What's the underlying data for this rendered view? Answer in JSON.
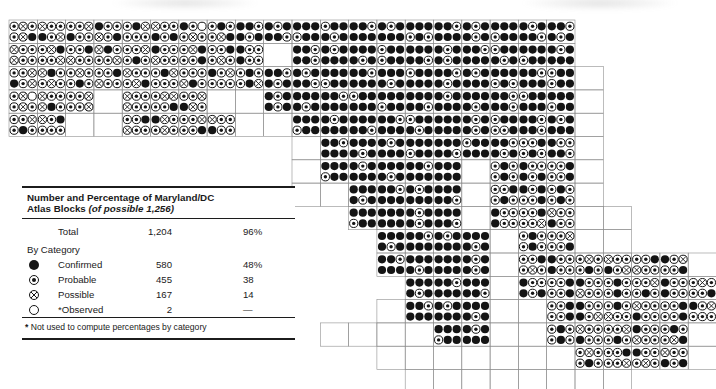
{
  "figure": {
    "kind": "atlas-distribution-map",
    "region": "Maryland/DC"
  },
  "legend": {
    "title_line1": "Number and Percentage of Maryland/DC",
    "title_line2_bold": "Atlas Blocks ",
    "title_line2_italic": "(of possible 1,256)",
    "total": {
      "label": "Total",
      "value": "1,204",
      "pct": "96%"
    },
    "by_category_label": "By Category",
    "categories": [
      {
        "symbol": "confirmed-symbol",
        "label": "Confirmed",
        "value": "580",
        "pct": "48%"
      },
      {
        "symbol": "probable-symbol",
        "label": "Probable",
        "value": "455",
        "pct": "38"
      },
      {
        "symbol": "possible-symbol",
        "label": "Possible",
        "value": "167",
        "pct": "14"
      },
      {
        "symbol": "observed-symbol",
        "label": "*Observed",
        "value": "2",
        "pct": "—"
      }
    ],
    "footnote_star": "*",
    "footnote_text": " Not used to compute percentages by category"
  },
  "map": {
    "grid": {
      "x0": 9,
      "y0": 20,
      "cell_w": 28.3,
      "cell_h": 23.3,
      "cols": 25,
      "rows": 16
    },
    "symbol_key": {
      "C": "confirmed",
      "P": "probable",
      "X": "possible",
      "O": "observed"
    },
    "colors": {
      "ink": "#141414",
      "grid": "#8f8f8f",
      "paper": "#ffffff"
    },
    "rows": [
      {
        "r": 0,
        "segs": [
          {
            "c": 0,
            "blocks": [
              "PXPPXC",
              "XPPCPX",
              "PPXCPP",
              "CPPXPC",
              "PCXPPP",
              "XPPCPC",
              "CPOPXP",
              "PCPPXC",
              "CCPCPC",
              "CPCCCP",
              "CCCPCC",
              "PCCCPC",
              "CCPCCC",
              "CPCCCC",
              "CCCPCP",
              "CCPCCC",
              "CPCCPC",
              "CCCPCC",
              "CPCCCP",
              "CCPCPC"
            ]
          }
        ]
      },
      {
        "r": 1,
        "segs": [
          {
            "c": 0,
            "blocks": [
              "XPPXPP",
              "PXCPPX",
              "PPCXPP",
              "XCPPPX",
              "PPXPCP",
              "CPPXPP",
              "PXCPPC",
              "PPCPXP",
              "CPPCPP"
            ]
          },
          {
            "c": 10,
            "blocks": [
              "CCPCCP",
              "CPCCCC",
              "CCCCPC",
              "PCCPCC",
              "CCCCCP",
              "CPCCPC",
              "CCPCCC",
              "PCCCPC",
              "CCCPCC",
              "CPCCCC"
            ]
          }
        ]
      },
      {
        "r": 2,
        "segs": [
          {
            "c": 0,
            "blocks": [
              "PPXCPX",
              "XCPPXP",
              "PXPPCP",
              "PPCXPP",
              "XPPPXC",
              "PCXPPP",
              "PPPXCP",
              "CPXPPP",
              "PCPPCX",
              "CCPCPC",
              "CPCCCP",
              "CCCPCC",
              "CCPCCC",
              "CCCCPC",
              "PCCCCC",
              "CCPCPC",
              "CPCCCC",
              "CCCPCP",
              "CCPCCC",
              "PCCPCC"
            ]
          }
        ]
      },
      {
        "r": 3,
        "segs": [
          {
            "c": 0,
            "blocks": [
              "PXOPXP",
              "XPPXCP",
              "PPXPPX"
            ]
          },
          {
            "c": 4,
            "blocks": [
              "XPPXPP",
              "PXXPPC",
              "PPXCXP"
            ]
          },
          {
            "c": 9,
            "blocks": [
              "CPCCPC",
              "CCCCPC",
              "CCPCCC",
              "PCCCCC",
              "CCCPCC",
              "CCCCCP",
              "CPCCCC",
              "CCCCPC",
              "CCPCCP",
              "PCCCCC",
              "CCCPCC"
            ]
          }
        ]
      },
      {
        "r": 4,
        "segs": [
          {
            "c": 0,
            "blocks": [
              "PPXPCP",
              "XPCPPP"
            ]
          },
          {
            "c": 4,
            "blocks": [
              "PPCXPP",
              "CXPPXP",
              "PPXPPC",
              "XPPCPP"
            ]
          },
          {
            "c": 10,
            "blocks": [
              "CCCPCC",
              "CPCCCC",
              "CCCCCP",
              "CCPCCC",
              "PCCCPC",
              "CCCCCC",
              "CPCCPC",
              "PCCPPC",
              "CCPCCP",
              "CPCCCC"
            ]
          }
        ]
      },
      {
        "r": 5,
        "segs": [
          {
            "c": 11,
            "blocks": [
              "CCPCCC",
              "CCCCPC",
              "CPCCCC",
              "CCCPCC",
              "CCCCCP",
              "PCCCCC",
              "CCPCPC",
              "PPCPCP",
              "CPPCCP"
            ]
          }
        ]
      },
      {
        "r": 6,
        "segs": [
          {
            "c": 11,
            "blocks": [
              "CCCPCC",
              "CPCCCC",
              "CCCCPC",
              "CCPCCC",
              "CCCCCC"
            ]
          },
          {
            "c": 17,
            "blocks": [
              "PCPPCP",
              "CPPCPC",
              "PPCPPC"
            ]
          }
        ]
      },
      {
        "r": 7,
        "segs": [
          {
            "c": 12,
            "blocks": [
              "CCCCPC",
              "CCPCCC",
              "CPCCCC",
              "CCCCCP"
            ]
          },
          {
            "c": 17,
            "blocks": [
              "PPCPCP",
              "CPCPPC",
              "PCPPCP"
            ]
          }
        ]
      },
      {
        "r": 8,
        "segs": [
          {
            "c": 12,
            "blocks": [
              "CCCPCC",
              "CCCCCC",
              "CPCCPC",
              "CCCCCP"
            ]
          },
          {
            "c": 17,
            "blocks": [
              "CPPCPP",
              "PPCPPX",
              "XPPCPP"
            ]
          }
        ]
      },
      {
        "r": 9,
        "segs": [
          {
            "c": 13,
            "blocks": [
              "CCCCPC",
              "CCPCCC",
              "CPCCCC",
              "CCCCPC"
            ]
          },
          {
            "c": 18,
            "blocks": [
              "PCPPCP",
              "PPXPPC"
            ]
          }
        ]
      },
      {
        "r": 10,
        "segs": [
          {
            "c": 13,
            "blocks": [
              "CCPCCC",
              "CCCCPC",
              "CCCCCC",
              "CPCCPC"
            ]
          },
          {
            "c": 18,
            "blocks": [
              "PPCPXP",
              "CPPCPP",
              "PXPPCP",
              "XPPCPX",
              "PPCXPP",
              "CPXPPC"
            ]
          }
        ]
      },
      {
        "r": 11,
        "segs": [
          {
            "c": 14,
            "blocks": [
              "CCCCPC",
              "CCPCCC",
              "CCCCCP"
            ]
          },
          {
            "c": 18,
            "blocks": [
              "CPPCPC",
              "PPCPPC",
              "CPPXPP",
              "PCPPCP",
              "PPXPCP",
              "CPPCPP",
              "PXPPPC"
            ]
          }
        ]
      },
      {
        "r": 12,
        "segs": [
          {
            "c": 14,
            "blocks": [
              "CCPCCC",
              "CPCCCC",
              "CCCCPC"
            ]
          },
          {
            "c": 19,
            "blocks": [
              "PPCPPC",
              "CPPCPX",
              "PCPXPP",
              "XPPCPP",
              "PPCPPC",
              "CPXPPP"
            ]
          }
        ]
      },
      {
        "r": 13,
        "segs": [
          {
            "c": 15,
            "blocks": [
              "CCCPCC",
              "CPCCCC"
            ]
          },
          {
            "c": 19,
            "blocks": [
              "PCPPCP",
              "XPPCPP",
              "PPXPCP",
              "CPPXPP",
              "PCPPXC"
            ]
          }
        ]
      },
      {
        "r": 14,
        "segs": [
          {
            "c": 20,
            "blocks": [
              "PXPPCP",
              "PPCPPX",
              "CPPPXP",
              "XPPCPC"
            ]
          }
        ]
      }
    ],
    "empty_cells": [
      [
        1,
        9
      ],
      [
        2,
        20
      ],
      [
        3,
        3
      ],
      [
        3,
        7
      ],
      [
        3,
        8
      ],
      [
        3,
        20
      ],
      [
        4,
        2
      ],
      [
        4,
        3
      ],
      [
        4,
        8
      ],
      [
        4,
        9
      ],
      [
        4,
        20
      ],
      [
        5,
        10
      ],
      [
        5,
        20
      ],
      [
        6,
        10
      ],
      [
        6,
        16
      ],
      [
        6,
        20
      ],
      [
        7,
        10
      ],
      [
        7,
        11
      ],
      [
        7,
        16
      ],
      [
        7,
        20
      ],
      [
        8,
        16
      ],
      [
        8,
        20
      ],
      [
        8,
        21
      ],
      [
        9,
        17
      ],
      [
        9,
        20
      ],
      [
        9,
        21
      ],
      [
        10,
        17
      ],
      [
        10,
        24
      ],
      [
        11,
        17
      ],
      [
        12,
        13
      ],
      [
        12,
        17
      ],
      [
        12,
        18
      ],
      [
        13,
        11
      ],
      [
        13,
        12
      ],
      [
        13,
        13
      ],
      [
        13,
        14
      ],
      [
        13,
        17
      ],
      [
        13,
        18
      ],
      [
        13,
        24
      ],
      [
        14,
        13
      ],
      [
        14,
        14
      ],
      [
        14,
        15
      ],
      [
        14,
        16
      ],
      [
        14,
        17
      ],
      [
        14,
        18
      ],
      [
        14,
        19
      ],
      [
        14,
        24
      ],
      [
        15,
        14
      ],
      [
        15,
        15
      ],
      [
        15,
        16
      ],
      [
        15,
        17
      ],
      [
        15,
        18
      ],
      [
        15,
        19
      ],
      [
        15,
        20
      ],
      [
        15,
        21
      ]
    ]
  }
}
